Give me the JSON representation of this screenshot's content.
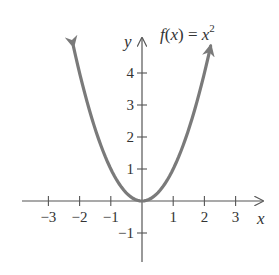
{
  "chart_data": {
    "type": "line",
    "title_parts": {
      "func": "f",
      "open": "(",
      "var": "x",
      "close": ")",
      "eq": " = ",
      "base": "x",
      "exp": "2"
    },
    "xlabel": "x",
    "ylabel": "y",
    "xlim": [
      -3.8,
      3.9
    ],
    "ylim": [
      -1.9,
      5.0
    ],
    "grid": false,
    "legend": "none",
    "x_ticks": [
      -3,
      -2,
      -1,
      1,
      2,
      3
    ],
    "x_tick_labels": [
      "−3",
      "−2",
      "−1",
      "1",
      "2",
      "3"
    ],
    "y_ticks": [
      -1,
      1,
      2,
      3,
      4
    ],
    "y_tick_labels": [
      "−1",
      "1",
      "2",
      "3",
      "4"
    ],
    "series": [
      {
        "name": "f(x) = x^2",
        "color": "#7a7a7a",
        "x": [
          -2.2,
          -2,
          -1.5,
          -1,
          -0.5,
          0,
          0.5,
          1,
          1.5,
          2,
          2.2
        ],
        "values": [
          4.84,
          4,
          2.25,
          1,
          0.25,
          0,
          0.25,
          1,
          2.25,
          4,
          4.84
        ],
        "arrows_both_ends": true
      }
    ],
    "axis_color": "#555555"
  }
}
